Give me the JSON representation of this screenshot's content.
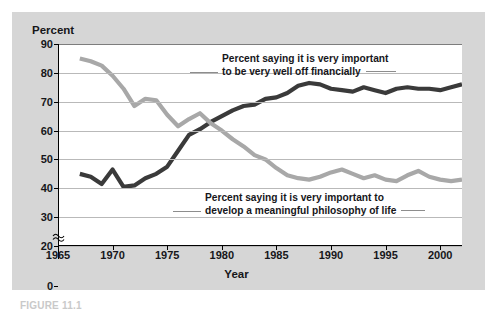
{
  "figure": {
    "caption": "FIGURE 11.1",
    "panel_color": "#d6d6d6",
    "plot_bg": "#ffffff"
  },
  "chart_data": {
    "type": "line",
    "title": "",
    "xlabel": "Year",
    "ylabel": "Percent",
    "xlim": [
      1965,
      2002
    ],
    "ylim": [
      20,
      90
    ],
    "y_axis_break": true,
    "y_axis_break_between": [
      0,
      20
    ],
    "grid": true,
    "legend_position": "inline-annotation",
    "xticks": [
      1965,
      1970,
      1975,
      1980,
      1985,
      1990,
      1995,
      2000
    ],
    "yticks": [
      0,
      20,
      30,
      40,
      50,
      60,
      70,
      80,
      90
    ],
    "xtick_labels": [
      "1965",
      "1970",
      "1975",
      "1980",
      "1985",
      "1990",
      "1995",
      "2000"
    ],
    "ytick_labels": [
      "0",
      "20",
      "30",
      "40",
      "50",
      "60",
      "70",
      "80",
      "90"
    ],
    "series": [
      {
        "name": "Percent saying it is very important to be very well off financially",
        "color": "#3a3a3a",
        "x": [
          1967,
          1968,
          1969,
          1970,
          1971,
          1972,
          1973,
          1974,
          1975,
          1976,
          1977,
          1978,
          1979,
          1980,
          1981,
          1982,
          1983,
          1984,
          1985,
          1986,
          1987,
          1988,
          1989,
          1990,
          1991,
          1992,
          1993,
          1994,
          1995,
          1996,
          1997,
          1998,
          1999,
          2000,
          2001,
          2002
        ],
        "values": [
          45,
          44,
          41.5,
          46.5,
          40.5,
          41,
          43.5,
          45,
          47.5,
          53,
          58.5,
          60.5,
          63,
          65,
          67,
          68.5,
          69,
          71,
          71.5,
          73,
          75.5,
          76.5,
          76,
          74.5,
          74,
          73.5,
          75,
          74,
          73,
          74.5,
          75,
          74.5,
          74.5,
          74,
          75,
          76
        ]
      },
      {
        "name": "Percent saying it is very important to develop a meaningful philosophy of life",
        "color": "#a8a8a8",
        "x": [
          1967,
          1968,
          1969,
          1970,
          1971,
          1972,
          1973,
          1974,
          1975,
          1976,
          1977,
          1978,
          1979,
          1980,
          1981,
          1982,
          1983,
          1984,
          1985,
          1986,
          1987,
          1988,
          1989,
          1990,
          1991,
          1992,
          1993,
          1994,
          1995,
          1996,
          1997,
          1998,
          1999,
          2000,
          2001,
          2002
        ],
        "values": [
          85,
          84,
          82.5,
          79,
          74.5,
          68.5,
          71,
          70.5,
          65.5,
          61.5,
          64,
          66,
          62.5,
          60,
          57,
          54.5,
          51.5,
          50,
          47,
          44.5,
          43.5,
          43,
          44,
          45.5,
          46.5,
          45,
          43.5,
          44.5,
          43,
          42.5,
          44.5,
          46,
          44,
          43,
          42.5,
          43
        ]
      }
    ],
    "annotations": [
      {
        "name": "annot-dark",
        "lines": [
          "Percent saying it is very important",
          "to be very well off financially"
        ],
        "target_series": "Percent saying it is very important to be very well off financially"
      },
      {
        "name": "annot-light",
        "lines": [
          "Percent saying it is very important to",
          "develop a meaningful philosophy of life"
        ],
        "target_series": "Percent saying it is very important to develop a meaningful philosophy of life"
      }
    ]
  }
}
